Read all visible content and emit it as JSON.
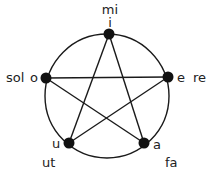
{
  "diagram": {
    "type": "pentagram-in-circle",
    "circle": {
      "cx": 107,
      "cy": 96,
      "r": 62
    },
    "nodes": [
      {
        "id": "i",
        "vowel": "i",
        "syllable": "mi",
        "x": 109,
        "y": 34
      },
      {
        "id": "e",
        "vowel": "e",
        "syllable": "re",
        "x": 168,
        "y": 77
      },
      {
        "id": "a",
        "vowel": "a",
        "syllable": "fa",
        "x": 144,
        "y": 143
      },
      {
        "id": "u",
        "vowel": "u",
        "syllable": "ut",
        "x": 69,
        "y": 143
      },
      {
        "id": "o",
        "vowel": "o",
        "syllable": "sol",
        "x": 46,
        "y": 78
      }
    ],
    "edges": [
      [
        "i",
        "a"
      ],
      [
        "a",
        "o"
      ],
      [
        "o",
        "e"
      ],
      [
        "e",
        "u"
      ],
      [
        "u",
        "i"
      ]
    ],
    "colors": {
      "stroke": "#1a1a1a",
      "node": "#111111",
      "text": "#222222"
    }
  }
}
